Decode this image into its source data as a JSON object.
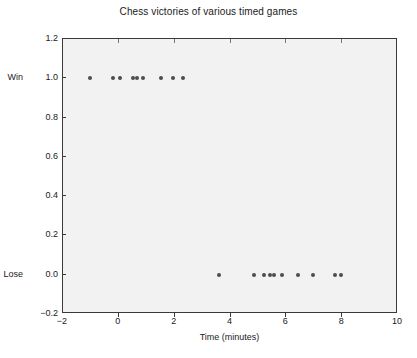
{
  "chart_data": {
    "type": "scatter",
    "title": "Chess victories of various timed games",
    "xlabel": "Time (minutes)",
    "ylabel": "",
    "xlim": [
      -2,
      10
    ],
    "ylim": [
      -0.2,
      1.2
    ],
    "grid": false,
    "legend": null,
    "xticks": [
      "-2",
      "0",
      "2",
      "4",
      "6",
      "8",
      "10"
    ],
    "xtick_values": [
      -2,
      0,
      2,
      4,
      6,
      8,
      10
    ],
    "yticks": [
      "-0.2",
      "0.0",
      "0.2",
      "0.4",
      "0.6",
      "0.8",
      "1.0",
      "1.2"
    ],
    "ytick_values": [
      -0.2,
      0.0,
      0.2,
      0.4,
      0.6,
      0.8,
      1.0,
      1.2
    ],
    "y_category_labels": [
      {
        "label": "Win",
        "value": 1.0
      },
      {
        "label": "Lose",
        "value": 0.0
      }
    ],
    "marker_color": "#4d4d4d",
    "plot_bg_color": "#f2f2f2",
    "series": [
      {
        "name": "games",
        "points": [
          {
            "x": -1.05,
            "y": 1.0
          },
          {
            "x": -0.2,
            "y": 1.0
          },
          {
            "x": 0.05,
            "y": 1.0
          },
          {
            "x": 0.5,
            "y": 1.0
          },
          {
            "x": 0.65,
            "y": 1.0
          },
          {
            "x": 0.85,
            "y": 1.0
          },
          {
            "x": 1.5,
            "y": 1.0
          },
          {
            "x": 1.95,
            "y": 1.0
          },
          {
            "x": 2.3,
            "y": 1.0
          },
          {
            "x": 3.6,
            "y": 0.0
          },
          {
            "x": 4.85,
            "y": 0.0
          },
          {
            "x": 5.2,
            "y": 0.0
          },
          {
            "x": 5.4,
            "y": 0.0
          },
          {
            "x": 5.55,
            "y": 0.0
          },
          {
            "x": 5.85,
            "y": 0.0
          },
          {
            "x": 6.4,
            "y": 0.0
          },
          {
            "x": 6.95,
            "y": 0.0
          },
          {
            "x": 7.75,
            "y": 0.0
          },
          {
            "x": 7.95,
            "y": 0.0
          }
        ]
      }
    ]
  }
}
